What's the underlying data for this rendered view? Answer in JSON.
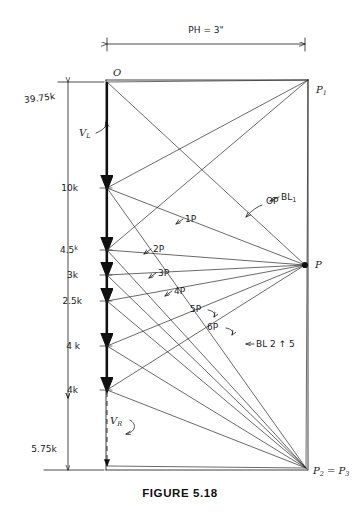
{
  "figure": {
    "caption": "FIGURE 5.18",
    "top_dimension": "PH = 3\"",
    "type": "force-polygon / load-line construction"
  },
  "points": {
    "origin": "O",
    "pole_p1": "P",
    "pole_p1_sub": "1",
    "pole_p": "P",
    "pole_p23": "P",
    "pole_p23_sub": "2",
    "pole_p23_eq": "= P",
    "pole_p23_sub2": "3"
  },
  "reactions": {
    "left_total": "39.75k",
    "left_label": "VL",
    "left_label_sub": "L",
    "right_total": "5.75k",
    "right_label": "VR",
    "right_label_sub": "R"
  },
  "loads": [
    {
      "label": "10k",
      "value": 10.0,
      "y": 188
    },
    {
      "label": "4.5",
      "unit": "k",
      "value": 4.5,
      "y": 250
    },
    {
      "label": "3k",
      "value": 3.0,
      "y": 275
    },
    {
      "label": "2.5k",
      "value": 2.5,
      "y": 301
    },
    {
      "label": "4 k",
      "value": 4.0,
      "y": 346
    },
    {
      "label": "4k",
      "value": 4.0,
      "y": 390
    }
  ],
  "ray_labels": [
    {
      "text": "OP",
      "x": 262,
      "y": 201
    },
    {
      "text": "1P",
      "x": 190,
      "y": 219
    },
    {
      "text": "2P",
      "x": 155,
      "y": 249
    },
    {
      "text": "3P",
      "x": 160,
      "y": 273
    },
    {
      "text": "4P",
      "x": 175,
      "y": 291
    },
    {
      "text": "5P",
      "x": 196,
      "y": 309
    },
    {
      "text": "6P",
      "x": 213,
      "y": 327
    }
  ],
  "annotations": [
    {
      "name": "bl1-label",
      "text": "BL",
      "sub": "1",
      "x": 281,
      "y": 197
    },
    {
      "name": "bl25-label",
      "text": "BL 2 ↑ 5",
      "x": 253,
      "y": 344
    }
  ],
  "colors": {
    "ink": "#1a1a1a",
    "paper": "#ffffff",
    "load_line": "#101010"
  }
}
